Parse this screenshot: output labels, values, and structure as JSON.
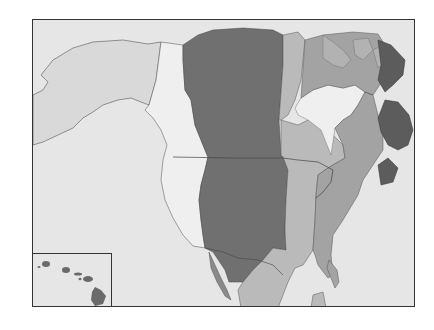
{
  "map": {
    "subject": "North America time zones",
    "style": "grayscale",
    "zones": [
      {
        "name": "alaska",
        "color": "#d9d9d9"
      },
      {
        "name": "pacific",
        "color": "#efefef"
      },
      {
        "name": "mountain",
        "color": "#707070"
      },
      {
        "name": "central",
        "color": "#bababa"
      },
      {
        "name": "eastern",
        "color": "#a3a3a3"
      },
      {
        "name": "atlantic",
        "color": "#5c5c5c"
      },
      {
        "name": "hawaii",
        "color": "#6a6a6a"
      }
    ],
    "ocean_color": "#e6e6e6",
    "border_color": "#333333",
    "inset": {
      "subject": "Hawaii"
    }
  }
}
